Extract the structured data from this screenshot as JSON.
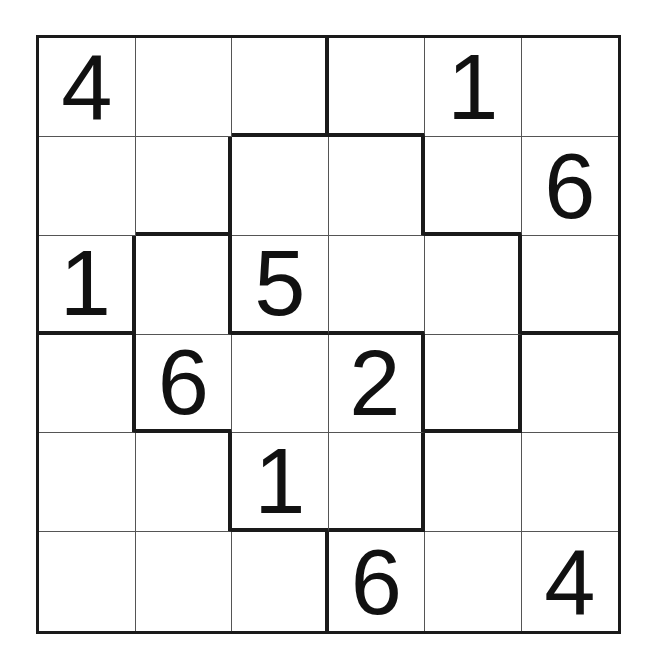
{
  "puzzle": {
    "type": "jigsaw-sudoku-6x6",
    "size": 6,
    "grid": [
      [
        "4",
        "",
        "",
        "",
        "1",
        ""
      ],
      [
        "",
        "",
        "",
        "",
        "",
        "6"
      ],
      [
        "1",
        "",
        "5",
        "",
        "",
        ""
      ],
      [
        "",
        "6",
        "",
        "2",
        "",
        ""
      ],
      [
        "",
        "",
        "1",
        "",
        "",
        ""
      ],
      [
        "",
        "",
        "",
        "6",
        "",
        "4"
      ]
    ],
    "regions": [
      [
        "A",
        "A",
        "A",
        "B",
        "B",
        "B"
      ],
      [
        "A",
        "A",
        "C",
        "C",
        "B",
        "B"
      ],
      [
        "A",
        "D",
        "C",
        "C",
        "C",
        "B"
      ],
      [
        "E",
        "D",
        "D",
        "D",
        "C",
        "F"
      ],
      [
        "E",
        "E",
        "D",
        "D",
        "F",
        "F"
      ],
      [
        "E",
        "E",
        "E",
        "F",
        "F",
        "F"
      ]
    ]
  },
  "colors": {
    "line": "#1a1a1a",
    "digit": "#111111",
    "background": "#ffffff"
  }
}
